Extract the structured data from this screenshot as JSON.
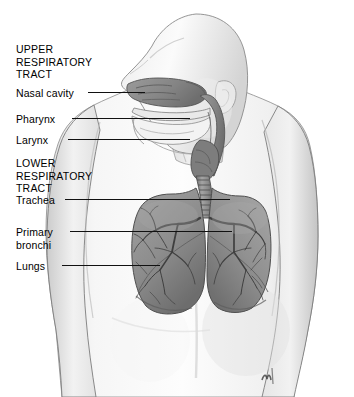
{
  "figure": {
    "width": 354,
    "height": 397,
    "background_color": "#ffffff",
    "signature": "artist-signature-mark"
  },
  "labels": [
    {
      "id": "upper-tract-heading",
      "text": "UPPER\nRESPIRATORY\nTRACT",
      "x": 16,
      "y": 43,
      "is_heading": true
    },
    {
      "id": "nasal-cavity",
      "text": "Nasal cavity",
      "x": 16,
      "y": 87,
      "is_heading": false
    },
    {
      "id": "pharynx",
      "text": "Pharynx",
      "x": 16,
      "y": 113,
      "is_heading": false
    },
    {
      "id": "larynx",
      "text": "Larynx",
      "x": 16,
      "y": 134,
      "is_heading": false
    },
    {
      "id": "lower-tract-heading",
      "text": "LOWER\nRESPIRATORY\nTRACT",
      "x": 16,
      "y": 157,
      "is_heading": true
    },
    {
      "id": "trachea",
      "text": "Trachea",
      "x": 16,
      "y": 194,
      "is_heading": false
    },
    {
      "id": "primary-bronchi",
      "text": "Primary\nbronchi",
      "x": 16,
      "y": 226,
      "is_heading": false
    },
    {
      "id": "lungs",
      "text": "Lungs",
      "x": 16,
      "y": 260,
      "is_heading": false
    }
  ],
  "leader_lines": [
    {
      "id": "leader-nasal-cavity",
      "x": 88,
      "y": 92,
      "length": 57
    },
    {
      "id": "leader-pharynx",
      "x": 72,
      "y": 118,
      "length": 118
    },
    {
      "id": "leader-larynx",
      "x": 68,
      "y": 139,
      "length": 122
    },
    {
      "id": "leader-trachea",
      "x": 65,
      "y": 199,
      "length": 165
    },
    {
      "id": "leader-primary-bronchi",
      "x": 70,
      "y": 231,
      "length": 162
    },
    {
      "id": "leader-lungs",
      "x": 62,
      "y": 265,
      "length": 98
    }
  ],
  "colors": {
    "line": "#111111",
    "skin_light": "#f4f4f4",
    "skin_mid": "#dcdcdc",
    "skin_shadow": "#b8b8b8",
    "airway_dark": "#8d8d8d",
    "airway_mid": "#a6a6a6",
    "lung_fill": "#8f8f8f",
    "lung_shadow": "#6f6f6f",
    "bronchi_stroke": "#4a4a4a",
    "outline": "#5a5a5a"
  }
}
